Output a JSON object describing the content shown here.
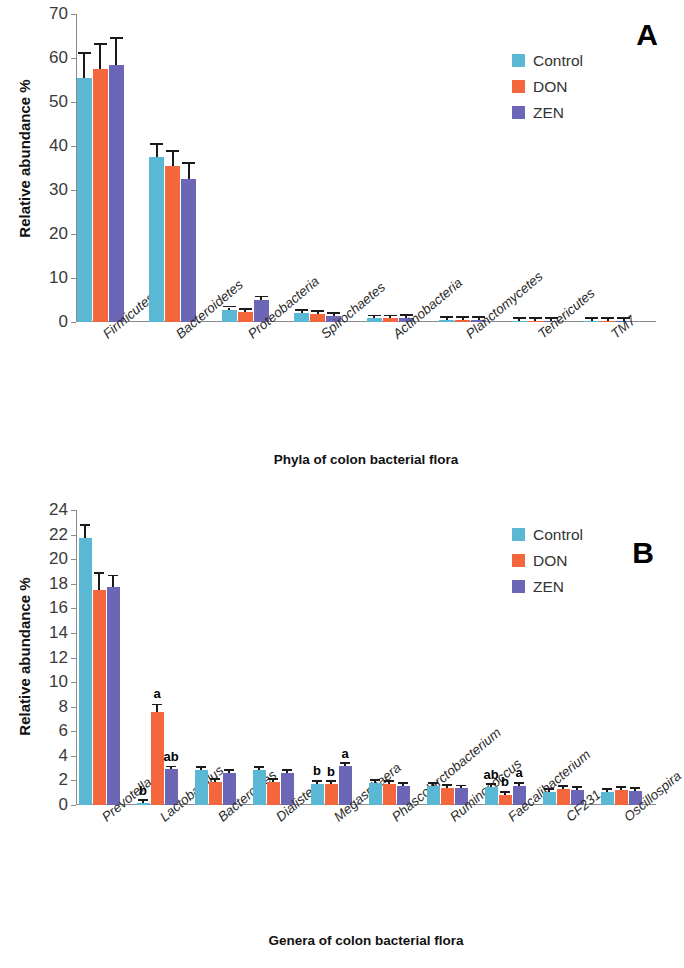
{
  "figure": {
    "panels": [
      {
        "letter": "A",
        "chart_data": {
          "type": "bar",
          "title": "",
          "xlabel": "Phyla of colon bacterial flora",
          "ylabel": "Relative abundance %",
          "ylim": [
            0,
            70
          ],
          "ytick_step": 10,
          "yticks": [
            0,
            10,
            20,
            30,
            40,
            50,
            60,
            70
          ],
          "grid": false,
          "legend_position": "top-right",
          "categories": [
            "Firmicutes",
            "Bacteroidetes",
            "Proteobacteria",
            "Spirochaetes",
            "Actinobacteria",
            "Planctomycetes",
            "Tenericutes",
            "TM7"
          ],
          "series": [
            {
              "name": "Control",
              "color": "#5BB8D4",
              "values": [
                55.5,
                37.5,
                2.8,
                2.0,
                0.8,
                0.5,
                0.25,
                0.2
              ],
              "errors": [
                5.5,
                2.8,
                0.5,
                0.3,
                0.2,
                0.1,
                0.08,
                0.06
              ]
            },
            {
              "name": "DON",
              "color": "#F4663C",
              "values": [
                57.5,
                35.5,
                2.3,
                1.8,
                0.8,
                0.5,
                0.25,
                0.2
              ],
              "errors": [
                5.5,
                3.2,
                0.4,
                0.3,
                0.2,
                0.1,
                0.08,
                0.06
              ]
            },
            {
              "name": "ZEN",
              "color": "#6B66B5",
              "values": [
                58.5,
                32.5,
                5.0,
                1.3,
                1.0,
                0.5,
                0.25,
                0.2
              ],
              "errors": [
                5.8,
                3.4,
                0.6,
                0.3,
                0.2,
                0.1,
                0.08,
                0.06
              ]
            }
          ],
          "significance_labels": []
        }
      },
      {
        "letter": "B",
        "chart_data": {
          "type": "bar",
          "title": "",
          "xlabel": "Genera of colon bacterial flora",
          "ylabel": "Relative abundance %",
          "ylim": [
            0,
            24
          ],
          "ytick_step": 2,
          "yticks": [
            0,
            2,
            4,
            6,
            8,
            10,
            12,
            14,
            16,
            18,
            20,
            22,
            24
          ],
          "grid": false,
          "legend_position": "top-right",
          "categories": [
            "Prevotella",
            "Lactobacillus",
            "Bacteroides",
            "Dialister",
            "Megasphaera",
            "Phascolarctobacterium",
            "Ruminococcus",
            "Faecalibacterium",
            "CF231",
            "Oscillospira"
          ],
          "series": [
            {
              "name": "Control",
              "color": "#5BB8D4",
              "values": [
                21.7,
                0.2,
                2.85,
                2.85,
                1.75,
                1.8,
                1.55,
                1.45,
                1.05,
                1.05
              ],
              "errors": [
                1.0,
                0.05,
                0.1,
                0.1,
                0.1,
                0.1,
                0.1,
                0.1,
                0.08,
                0.08
              ]
            },
            {
              "name": "DON",
              "color": "#F4663C",
              "values": [
                17.5,
                7.6,
                1.9,
                1.9,
                1.7,
                1.75,
                1.4,
                0.85,
                1.3,
                1.2
              ],
              "errors": [
                1.3,
                0.5,
                0.15,
                0.15,
                0.1,
                0.1,
                0.1,
                0.12,
                0.15,
                0.1
              ]
            },
            {
              "name": "ZEN",
              "color": "#6B66B5",
              "values": [
                17.7,
                2.9,
                2.6,
                2.6,
                3.15,
                1.55,
                1.35,
                1.55,
                1.2,
                1.15
              ],
              "errors": [
                0.9,
                0.1,
                0.1,
                0.1,
                0.12,
                0.1,
                0.1,
                0.12,
                0.1,
                0.1
              ]
            }
          ],
          "significance_labels": [
            {
              "category": "Lactobacillus",
              "series": "Control",
              "text": "b"
            },
            {
              "category": "Lactobacillus",
              "series": "DON",
              "text": "a"
            },
            {
              "category": "Lactobacillus",
              "series": "ZEN",
              "text": "ab"
            },
            {
              "category": "Megasphaera",
              "series": "Control",
              "text": "b"
            },
            {
              "category": "Megasphaera",
              "series": "DON",
              "text": "b"
            },
            {
              "category": "Megasphaera",
              "series": "ZEN",
              "text": "a"
            },
            {
              "category": "Faecalibacterium",
              "series": "Control",
              "text": "ab"
            },
            {
              "category": "Faecalibacterium",
              "series": "DON",
              "text": "b"
            },
            {
              "category": "Faecalibacterium",
              "series": "ZEN",
              "text": "a"
            }
          ]
        }
      }
    ],
    "legend_entries": [
      {
        "label": "Control",
        "color": "#5BB8D4"
      },
      {
        "label": "DON",
        "color": "#F4663C"
      },
      {
        "label": "ZEN",
        "color": "#6B66B5"
      }
    ]
  }
}
